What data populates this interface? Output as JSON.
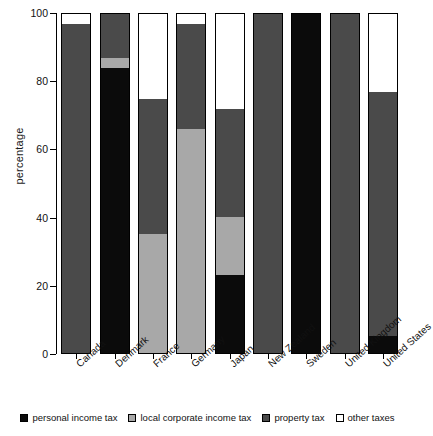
{
  "chart_data": {
    "type": "bar",
    "subtype": "stacked-bar-100",
    "title": "",
    "xlabel": "",
    "ylabel": "percentage",
    "ylim": [
      0,
      100
    ],
    "yticks": [
      0,
      20,
      40,
      60,
      80,
      100
    ],
    "grid": false,
    "legend_position": "bottom",
    "categories": [
      "Canada",
      "Denmark",
      "France",
      "Germany",
      "Japan",
      "New Zealand",
      "Sweden",
      "United Kingdom",
      "United States"
    ],
    "series": [
      {
        "name": "personal income tax",
        "color": "#0b0b0b",
        "values": [
          0,
          84,
          0,
          0,
          23,
          0,
          100,
          0,
          5
        ]
      },
      {
        "name": "local corporate income tax",
        "color": "#a8a8a8",
        "values": [
          0,
          3,
          35,
          66,
          17,
          0,
          0,
          0,
          0
        ]
      },
      {
        "name": "property tax",
        "color": "#4a4a4a",
        "values": [
          97,
          13,
          40,
          31,
          32,
          100,
          0,
          100,
          72
        ]
      },
      {
        "name": "other taxes",
        "color": "#ffffff",
        "values": [
          3,
          0,
          25,
          3,
          28,
          0,
          0,
          0,
          23
        ]
      }
    ]
  },
  "legend": [
    {
      "label": "personal income tax",
      "swatch": "sw-personal"
    },
    {
      "label": "local corporate income tax",
      "swatch": "sw-corporate"
    },
    {
      "label": "property tax",
      "swatch": "sw-property"
    },
    {
      "label": "other taxes",
      "swatch": "sw-other"
    }
  ]
}
